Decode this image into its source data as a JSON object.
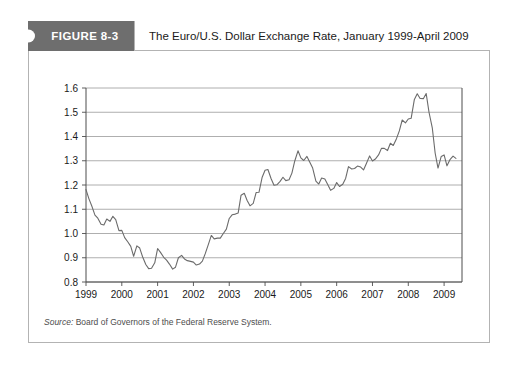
{
  "figure": {
    "tab_label": "FIGURE 8-3",
    "title": "The Euro/U.S. Dollar Exchange Rate, January 1999-April 2009",
    "source_label": "Source:",
    "source_text": " Board of Governors of the Federal Reserve System."
  },
  "colors": {
    "tab_background": "#6e6e6e",
    "tab_text": "#ffffff",
    "frame_border": "#b3b3b3",
    "gridline": "#9a9a9a",
    "axis": "#4d4d4d",
    "series_line": "#6b6b6b",
    "page_background": "#ffffff"
  },
  "chart_data": {
    "type": "line",
    "title": "The Euro/U.S. Dollar Exchange Rate, January 1999-April 2009",
    "xlabel": "",
    "ylabel": "",
    "xlim": [
      1999.0,
      2009.5
    ],
    "ylim": [
      0.8,
      1.6
    ],
    "grid": true,
    "legend": "none",
    "ytick_labels": [
      "0.8",
      "0.9",
      "1.0",
      "1.1",
      "1.2",
      "1.3",
      "1.4",
      "1.5",
      "1.6"
    ],
    "yticks": [
      0.8,
      0.9,
      1.0,
      1.1,
      1.2,
      1.3,
      1.4,
      1.5,
      1.6
    ],
    "xtick_labels": [
      "1999",
      "2000",
      "2001",
      "2002",
      "2003",
      "2004",
      "2005",
      "2006",
      "2007",
      "2008",
      "2009"
    ],
    "xticks": [
      1999,
      2000,
      2001,
      2002,
      2003,
      2004,
      2005,
      2006,
      2007,
      2008,
      2009
    ],
    "series": [
      {
        "name": "Euro/U.S. Dollar Exchange Rate",
        "x": [
          1999.0,
          1999.08,
          1999.17,
          1999.25,
          1999.33,
          1999.42,
          1999.5,
          1999.58,
          1999.67,
          1999.75,
          1999.83,
          1999.92,
          2000.0,
          2000.08,
          2000.17,
          2000.25,
          2000.33,
          2000.42,
          2000.5,
          2000.58,
          2000.67,
          2000.75,
          2000.83,
          2000.92,
          2001.0,
          2001.08,
          2001.17,
          2001.25,
          2001.33,
          2001.42,
          2001.5,
          2001.58,
          2001.67,
          2001.75,
          2001.83,
          2001.92,
          2002.0,
          2002.08,
          2002.17,
          2002.25,
          2002.33,
          2002.42,
          2002.5,
          2002.58,
          2002.67,
          2002.75,
          2002.83,
          2002.92,
          2003.0,
          2003.08,
          2003.17,
          2003.25,
          2003.33,
          2003.42,
          2003.5,
          2003.58,
          2003.67,
          2003.75,
          2003.83,
          2003.92,
          2004.0,
          2004.08,
          2004.17,
          2004.25,
          2004.33,
          2004.42,
          2004.5,
          2004.58,
          2004.67,
          2004.75,
          2004.83,
          2004.92,
          2005.0,
          2005.08,
          2005.17,
          2005.25,
          2005.33,
          2005.42,
          2005.5,
          2005.58,
          2005.67,
          2005.75,
          2005.83,
          2005.92,
          2006.0,
          2006.08,
          2006.17,
          2006.25,
          2006.33,
          2006.42,
          2006.5,
          2006.58,
          2006.67,
          2006.75,
          2006.83,
          2006.92,
          2007.0,
          2007.08,
          2007.17,
          2007.25,
          2007.33,
          2007.42,
          2007.5,
          2007.58,
          2007.67,
          2007.75,
          2007.83,
          2007.92,
          2008.0,
          2008.08,
          2008.17,
          2008.25,
          2008.33,
          2008.42,
          2008.5,
          2008.58,
          2008.67,
          2008.75,
          2008.83,
          2008.92,
          2009.0,
          2009.08,
          2009.17,
          2009.25,
          2009.33
        ],
        "y": [
          1.181,
          1.144,
          1.11,
          1.076,
          1.063,
          1.038,
          1.035,
          1.06,
          1.05,
          1.071,
          1.057,
          1.012,
          1.013,
          0.983,
          0.965,
          0.947,
          0.906,
          0.949,
          0.94,
          0.904,
          0.872,
          0.855,
          0.857,
          0.879,
          0.938,
          0.922,
          0.902,
          0.89,
          0.874,
          0.853,
          0.861,
          0.9,
          0.91,
          0.895,
          0.888,
          0.885,
          0.882,
          0.87,
          0.874,
          0.886,
          0.917,
          0.956,
          0.992,
          0.978,
          0.981,
          0.981,
          0.999,
          1.018,
          1.062,
          1.077,
          1.08,
          1.085,
          1.158,
          1.166,
          1.136,
          1.114,
          1.124,
          1.169,
          1.17,
          1.232,
          1.261,
          1.264,
          1.226,
          1.199,
          1.201,
          1.215,
          1.232,
          1.218,
          1.222,
          1.249,
          1.299,
          1.341,
          1.312,
          1.301,
          1.318,
          1.294,
          1.27,
          1.216,
          1.204,
          1.229,
          1.225,
          1.202,
          1.178,
          1.186,
          1.21,
          1.194,
          1.203,
          1.227,
          1.276,
          1.266,
          1.268,
          1.278,
          1.274,
          1.262,
          1.289,
          1.32,
          1.299,
          1.307,
          1.324,
          1.351,
          1.351,
          1.342,
          1.372,
          1.363,
          1.391,
          1.423,
          1.468,
          1.456,
          1.472,
          1.475,
          1.553,
          1.576,
          1.557,
          1.556,
          1.577,
          1.499,
          1.436,
          1.332,
          1.27,
          1.318,
          1.324,
          1.279,
          1.306,
          1.319,
          1.31
        ]
      }
    ]
  }
}
